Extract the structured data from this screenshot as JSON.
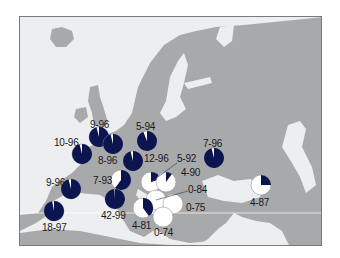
{
  "chart_data": {
    "type": "pie-map",
    "title": "",
    "region": "Europe",
    "colors": {
      "dark": "#0d1550",
      "light": "#ffffff",
      "land": "#a7a9ab",
      "sea": "#eceef0"
    },
    "grid": false,
    "legend": null,
    "pies": [
      {
        "label": "9-96",
        "n": 9,
        "pct": 96,
        "cx": 98,
        "cy": 136,
        "r": 10,
        "lx": 89,
        "ly": 119
      },
      {
        "label": "8-96",
        "n": 8,
        "pct": 96,
        "cx": 112,
        "cy": 143,
        "r": 10,
        "lx": 97,
        "ly": 155
      },
      {
        "label": "5-94",
        "n": 5,
        "pct": 94,
        "cx": 146,
        "cy": 140,
        "r": 10,
        "lx": 135,
        "ly": 121
      },
      {
        "label": "10-96",
        "n": 10,
        "pct": 96,
        "cx": 81,
        "cy": 153,
        "r": 10,
        "lx": 53,
        "ly": 137
      },
      {
        "label": "12-96",
        "n": 12,
        "pct": 96,
        "cx": 132,
        "cy": 160,
        "r": 10,
        "lx": 143,
        "ly": 153
      },
      {
        "label": "5-92",
        "n": 5,
        "pct": 20,
        "cx": 150,
        "cy": 181,
        "r": 10,
        "lx": 176,
        "ly": 153
      },
      {
        "label": "4-90",
        "n": 4,
        "pct": 10,
        "cx": 165,
        "cy": 181,
        "r": 10,
        "lx": 180,
        "ly": 167
      },
      {
        "label": "7-93",
        "n": 7,
        "pct": 60,
        "cx": 120,
        "cy": 179,
        "r": 10,
        "lx": 92,
        "ly": 175
      },
      {
        "label": "7-96",
        "n": 7,
        "pct": 96,
        "cx": 213,
        "cy": 157,
        "r": 10,
        "lx": 202,
        "ly": 138
      },
      {
        "label": "9-96",
        "n": 9,
        "pct": 96,
        "cx": 70,
        "cy": 188,
        "r": 10,
        "lx": 45,
        "ly": 177
      },
      {
        "label": "42-99",
        "n": 42,
        "pct": 99,
        "cx": 114,
        "cy": 198,
        "r": 10,
        "lx": 100,
        "ly": 210
      },
      {
        "label": "0-84",
        "n": 0,
        "pct": 0,
        "cx": 155,
        "cy": 199,
        "r": 10,
        "lx": 187,
        "ly": 184
      },
      {
        "label": "0-75",
        "n": 0,
        "pct": 0,
        "cx": 172,
        "cy": 203,
        "r": 10,
        "lx": 185,
        "ly": 202
      },
      {
        "label": "4-81",
        "n": 4,
        "pct": 40,
        "cx": 142,
        "cy": 207,
        "r": 10,
        "lx": 131,
        "ly": 220
      },
      {
        "label": "0-74",
        "n": 0,
        "pct": 0,
        "cx": 162,
        "cy": 216,
        "r": 10,
        "lx": 153,
        "ly": 227
      },
      {
        "label": "4-87",
        "n": 4,
        "pct": 25,
        "cx": 260,
        "cy": 184,
        "r": 10,
        "lx": 249,
        "ly": 197
      },
      {
        "label": "18-97",
        "n": 18,
        "pct": 97,
        "cx": 53,
        "cy": 210,
        "r": 10,
        "lx": 41,
        "ly": 222
      }
    ]
  }
}
